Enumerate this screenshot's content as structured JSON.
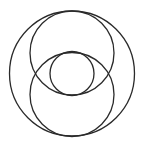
{
  "diagram": {
    "background": "#ffffff",
    "stroke_color": "#2a2a2a",
    "stroke_width": 1.3,
    "circles": [
      {
        "name": "outer-circle",
        "cx": 72,
        "cy": 73.5,
        "r": 62.5
      },
      {
        "name": "upper-circle",
        "cx": 72,
        "cy": 53,
        "r": 42
      },
      {
        "name": "lower-circle",
        "cx": 72,
        "cy": 94.5,
        "r": 42
      },
      {
        "name": "center-circle",
        "cx": 72,
        "cy": 73.5,
        "r": 22
      }
    ]
  }
}
